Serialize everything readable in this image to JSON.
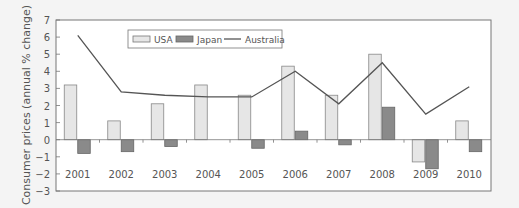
{
  "chart_data": {
    "type": "bar",
    "title": "",
    "xlabel": "",
    "ylabel": "Consumer prices (annual % change)",
    "ylim": [
      -3,
      7
    ],
    "yticks": [
      -3,
      -2,
      -1,
      0,
      1,
      2,
      3,
      4,
      5,
      6,
      7
    ],
    "ytick_labels": [
      "−3",
      "−2",
      "−1",
      "0",
      "1",
      "2",
      "3",
      "4",
      "5",
      "6",
      "7"
    ],
    "grid": false,
    "legend_position": "top-center inside",
    "categories": [
      "2001",
      "2002",
      "2003",
      "2004",
      "2005",
      "2006",
      "2007",
      "2008",
      "2009",
      "2010"
    ],
    "series": [
      {
        "name": "USA",
        "type": "bar",
        "color": "#e6e6e6",
        "values": [
          3.2,
          1.1,
          2.1,
          3.2,
          2.6,
          4.3,
          2.6,
          5.0,
          -1.3,
          1.1
        ]
      },
      {
        "name": "Japan",
        "type": "bar",
        "color": "#8a8a8a",
        "values": [
          -0.8,
          -0.7,
          -0.4,
          0.0,
          -0.5,
          0.5,
          -0.3,
          1.9,
          -1.7,
          -0.7
        ]
      },
      {
        "name": "Australia",
        "type": "line",
        "color": "#555555",
        "values": [
          6.1,
          2.8,
          2.6,
          2.5,
          2.5,
          4.0,
          2.1,
          4.5,
          1.5,
          3.1
        ]
      }
    ]
  },
  "legend": {
    "items": [
      {
        "label": "USA"
      },
      {
        "label": "Japan"
      },
      {
        "label": "Australia"
      }
    ]
  }
}
